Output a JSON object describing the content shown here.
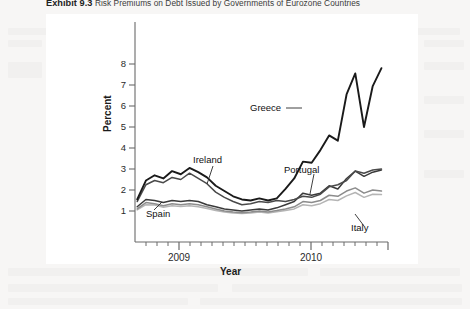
{
  "exhibit": {
    "number": "Exhibit 9.3",
    "caption": "Risk Premiums on Debt Issued by Governments of Eurozone Countries"
  },
  "chart_data": {
    "type": "line",
    "title": "Risk Premiums on Debt Issued by Governments of Eurozone Countries",
    "xlabel": "Year",
    "ylabel": "Percent",
    "xtick_labels": [
      "2009",
      "2010"
    ],
    "ytick_labels": [
      "1",
      "2",
      "3",
      "4",
      "5",
      "6",
      "7",
      "8"
    ],
    "ylim": [
      0.3,
      8.6
    ],
    "xlim": [
      2008.6,
      2010.92
    ],
    "grid": false,
    "legend_position": "inline-annotations",
    "annotations": [
      "Greece",
      "Ireland",
      "Portugal",
      "Spain",
      "Italy"
    ],
    "x": [
      2008.62,
      2008.7,
      2008.78,
      2008.86,
      2008.94,
      2009.02,
      2009.1,
      2009.18,
      2009.26,
      2009.34,
      2009.42,
      2009.5,
      2009.58,
      2009.66,
      2009.74,
      2009.82,
      2009.9,
      2009.98,
      2010.06,
      2010.14,
      2010.22,
      2010.3,
      2010.38,
      2010.46,
      2010.54,
      2010.62,
      2010.7,
      2010.78,
      2010.86
    ],
    "series": [
      {
        "name": "Greece",
        "color": "#1a1a1a",
        "values": [
          1.55,
          2.45,
          2.7,
          2.55,
          2.9,
          2.75,
          3.05,
          2.85,
          2.6,
          2.2,
          1.95,
          1.7,
          1.55,
          1.5,
          1.6,
          1.5,
          1.6,
          2.05,
          2.55,
          3.35,
          3.3,
          3.9,
          4.6,
          4.35,
          6.55,
          7.55,
          5.0,
          6.95,
          7.8
        ]
      },
      {
        "name": "Ireland",
        "color": "#4a4a4a",
        "values": [
          1.45,
          2.25,
          2.45,
          2.35,
          2.6,
          2.5,
          2.8,
          2.55,
          2.3,
          1.9,
          1.65,
          1.45,
          1.3,
          1.35,
          1.45,
          1.4,
          1.5,
          1.45,
          1.55,
          1.7,
          1.65,
          1.8,
          2.15,
          2.25,
          2.45,
          2.9,
          2.8,
          2.95,
          3.0
        ]
      },
      {
        "name": "Portugal",
        "color": "#3a3a3a",
        "values": [
          1.2,
          1.55,
          1.5,
          1.4,
          1.5,
          1.45,
          1.5,
          1.45,
          1.3,
          1.2,
          1.1,
          1.05,
          1.0,
          1.05,
          1.1,
          1.05,
          1.15,
          1.3,
          1.45,
          1.85,
          1.75,
          1.85,
          2.2,
          2.05,
          2.55,
          2.9,
          2.65,
          2.85,
          2.95
        ]
      },
      {
        "name": "Spain",
        "color": "#8c8c8c",
        "values": [
          1.1,
          1.4,
          1.35,
          1.25,
          1.35,
          1.3,
          1.35,
          1.3,
          1.2,
          1.1,
          1.0,
          0.95,
          0.92,
          0.95,
          1.0,
          0.95,
          1.02,
          1.1,
          1.2,
          1.45,
          1.4,
          1.5,
          1.75,
          1.7,
          1.95,
          2.1,
          1.85,
          2.0,
          1.95
        ]
      },
      {
        "name": "Italy",
        "color": "#b5b5b5",
        "values": [
          1.05,
          1.3,
          1.28,
          1.18,
          1.25,
          1.22,
          1.25,
          1.2,
          1.12,
          1.02,
          0.95,
          0.9,
          0.88,
          0.9,
          0.95,
          0.9,
          0.96,
          1.02,
          1.1,
          1.3,
          1.25,
          1.35,
          1.55,
          1.5,
          1.72,
          1.88,
          1.65,
          1.8,
          1.78
        ]
      }
    ]
  },
  "labels": {
    "greece": "Greece",
    "ireland": "Ireland",
    "portugal": "Portugal",
    "spain": "Spain",
    "italy": "Italy",
    "y_axis": "Percent",
    "x_axis": "Year",
    "ytick_8": "8",
    "ytick_7": "7",
    "ytick_6": "6",
    "ytick_5": "5",
    "ytick_4": "4",
    "ytick_3": "3",
    "ytick_2": "2",
    "ytick_1": "1",
    "xtick_2009": "2009",
    "xtick_2010": "2010"
  }
}
